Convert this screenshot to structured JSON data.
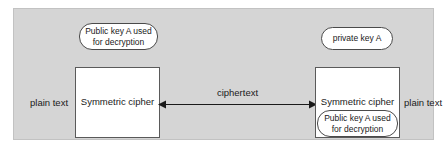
{
  "diagram": {
    "background_color": "#d5d5d5",
    "box_fill_color": "#ffffff",
    "line_color": "#1a1a1a",
    "left_side": {
      "plain_text_label": "plain text",
      "cipher_label": "Symmetric cipher",
      "key_callout": "Public key A used for decryption"
    },
    "right_side": {
      "plain_text_label": "plain text",
      "cipher_label": "Symmetric cipher",
      "key_callout_top": "private key A",
      "key_callout_inner": "Public key A used for decryption"
    },
    "connector": {
      "label": "ciphertext",
      "direction": "bidirectional"
    }
  }
}
